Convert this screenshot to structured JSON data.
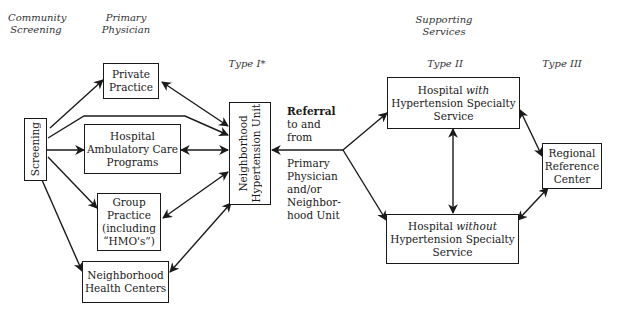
{
  "headers": {
    "community_screening": [
      "Community",
      "Screening"
    ],
    "primary_physician": [
      "Primary",
      "Physician"
    ],
    "supporting_services": [
      "Supporting",
      "Services"
    ],
    "type_i": "Type I*",
    "type_ii": "Type II",
    "type_iii": "Type III"
  },
  "nodes": {
    "screening": "Screening",
    "private_practice": [
      "Private",
      "Practice"
    ],
    "hospital_ambulatory": [
      "Hospital",
      "Ambulatory Care",
      "Programs"
    ],
    "group_practice": [
      "Group",
      "Practice",
      "(including",
      "“HMO's”)"
    ],
    "neighborhood_health": [
      "Neighborhood",
      "Health Centers"
    ],
    "neighborhood_unit": [
      "Neighborhood",
      "Hypertension Unit"
    ],
    "hospital_with": {
      "line1_pre": "Hospital ",
      "line1_em": "with",
      "line2": "Hypertension Specialty",
      "line3": "Service"
    },
    "hospital_without": {
      "line1_pre": "Hospital ",
      "line1_em": "without",
      "line2": "Hypertension Specialty",
      "line3": "Service"
    },
    "regional_reference": [
      "Regional",
      "Reference",
      "Center"
    ]
  },
  "referral_label": {
    "top": [
      "Referral",
      "to and",
      "from"
    ],
    "bottom": [
      "Primary",
      "Physician",
      "and/or",
      "Neighbor-",
      "hood Unit"
    ]
  },
  "colors": {
    "ink": "#1a1a1a",
    "background": "#ffffff"
  }
}
